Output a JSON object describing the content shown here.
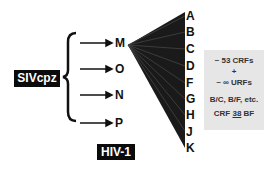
{
  "root": {
    "label": "SIVcpz"
  },
  "groups": [
    {
      "label": "M"
    },
    {
      "label": "O"
    },
    {
      "label": "N"
    },
    {
      "label": "P"
    }
  ],
  "virus": {
    "label": "HIV-1"
  },
  "subtypes": [
    "A",
    "B",
    "C",
    "D",
    "F",
    "G",
    "H",
    "J",
    "K"
  ],
  "recombinants": {
    "line1": "~ 53 CRFs",
    "line2": "+",
    "line3": "~ ∞ URFs",
    "line4": "B/C, B/F, etc.",
    "line5_prefix": "CRF ",
    "line5_num": "38",
    "line5_suffix": " BF"
  }
}
